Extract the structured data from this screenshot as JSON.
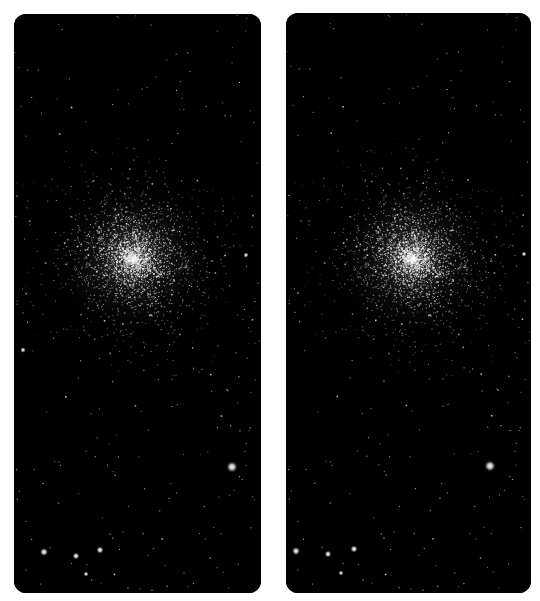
{
  "image": {
    "subject": "globular star cluster stereo pair",
    "background": "#ffffff",
    "panels": [
      {
        "id": "left",
        "box": [
          14,
          14,
          247,
          579
        ],
        "cluster_center": [
          119,
          244
        ],
        "cluster_radius": 95,
        "bright_stars": [
          [
            218,
            453,
            2.6
          ],
          [
            30,
            538,
            1.9
          ],
          [
            62,
            542,
            1.6
          ],
          [
            86,
            536,
            1.7
          ],
          [
            72,
            560,
            1.2
          ],
          [
            9,
            336,
            1.3
          ],
          [
            232,
            241,
            1.2
          ]
        ],
        "seed": 11
      },
      {
        "id": "right",
        "box": [
          286,
          13,
          245,
          580
        ],
        "cluster_center": [
          126,
          245
        ],
        "cluster_radius": 95,
        "bright_stars": [
          [
            204,
            453,
            2.6
          ],
          [
            10,
            538,
            1.9
          ],
          [
            42,
            541,
            1.6
          ],
          [
            68,
            536,
            1.7
          ],
          [
            55,
            560,
            1.2
          ],
          [
            238,
            241,
            1.2
          ]
        ],
        "seed": 11
      }
    ]
  }
}
